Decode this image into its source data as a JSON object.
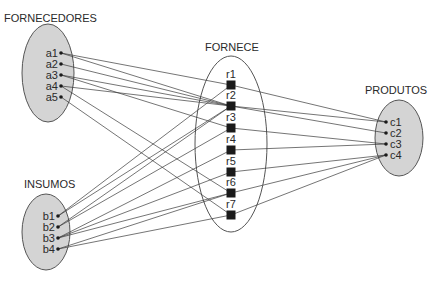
{
  "diagram": {
    "sets": [
      {
        "id": "fornecedores",
        "title": "FORNECEDORES",
        "title_x": 4,
        "title_y": 22,
        "cx": 48,
        "cy": 73,
        "rx": 26,
        "ry": 49,
        "fill": "#d4d4d4",
        "elements": [
          {
            "id": "a1",
            "label": "a1",
            "x": 61,
            "y": 53
          },
          {
            "id": "a2",
            "label": "a2",
            "x": 61,
            "y": 64
          },
          {
            "id": "a3",
            "label": "a3",
            "x": 61,
            "y": 75
          },
          {
            "id": "a4",
            "label": "a4",
            "x": 61,
            "y": 86
          },
          {
            "id": "a5",
            "label": "a5",
            "x": 61,
            "y": 97
          }
        ]
      },
      {
        "id": "insumos",
        "title": "INSUMOS",
        "title_x": 24,
        "title_y": 188,
        "cx": 46,
        "cy": 232,
        "rx": 24,
        "ry": 38,
        "fill": "#d4d4d4",
        "elements": [
          {
            "id": "b1",
            "label": "b1",
            "x": 58,
            "y": 216
          },
          {
            "id": "b2",
            "label": "b2",
            "x": 58,
            "y": 227
          },
          {
            "id": "b3",
            "label": "b3",
            "x": 58,
            "y": 238
          },
          {
            "id": "b4",
            "label": "b4",
            "x": 58,
            "y": 249
          }
        ]
      },
      {
        "id": "produtos",
        "title": "PRODUTOS",
        "title_x": 365,
        "title_y": 94,
        "cx": 399,
        "cy": 138,
        "rx": 24,
        "ry": 38,
        "fill": "#d4d4d4",
        "elements": [
          {
            "id": "c1",
            "label": "c1",
            "x": 386,
            "y": 122
          },
          {
            "id": "c2",
            "label": "c2",
            "x": 386,
            "y": 133
          },
          {
            "id": "c3",
            "label": "c3",
            "x": 386,
            "y": 144
          },
          {
            "id": "c4",
            "label": "c4",
            "x": 386,
            "y": 155
          }
        ]
      }
    ],
    "relation": {
      "id": "fornece",
      "title": "FORNECE",
      "title_x": 205,
      "title_y": 51,
      "cx": 231,
      "cy": 144,
      "rx": 36,
      "ry": 88,
      "fill": "#ffffff",
      "nodes": [
        {
          "id": "r1",
          "label": "r1",
          "x": 231,
          "y": 85
        },
        {
          "id": "r2",
          "label": "r2",
          "x": 231,
          "y": 106
        },
        {
          "id": "r3",
          "label": "r3",
          "x": 231,
          "y": 128
        },
        {
          "id": "r4",
          "label": "r4",
          "x": 231,
          "y": 150
        },
        {
          "id": "r5",
          "label": "r5",
          "x": 231,
          "y": 172
        },
        {
          "id": "r6",
          "label": "r6",
          "x": 231,
          "y": 193
        },
        {
          "id": "r7",
          "label": "r7",
          "x": 231,
          "y": 215
        }
      ]
    },
    "edges": [
      [
        "a1",
        "r1"
      ],
      [
        "a1",
        "r2"
      ],
      [
        "a2",
        "r2"
      ],
      [
        "a3",
        "r3"
      ],
      [
        "a3",
        "r2"
      ],
      [
        "a4",
        "r2"
      ],
      [
        "a4",
        "r6"
      ],
      [
        "a5",
        "r7"
      ],
      [
        "b1",
        "r1"
      ],
      [
        "b1",
        "r2"
      ],
      [
        "b2",
        "r2"
      ],
      [
        "b2",
        "r3"
      ],
      [
        "b3",
        "r4"
      ],
      [
        "b3",
        "r6"
      ],
      [
        "b3",
        "r5"
      ],
      [
        "b4",
        "r7"
      ],
      [
        "b4",
        "r6"
      ],
      [
        "r1",
        "c1"
      ],
      [
        "r2",
        "c1"
      ],
      [
        "r2",
        "c2"
      ],
      [
        "r3",
        "c3"
      ],
      [
        "r4",
        "c3"
      ],
      [
        "r5",
        "c4"
      ],
      [
        "r6",
        "c4"
      ],
      [
        "r7",
        "c4"
      ]
    ],
    "colors": {
      "line": "#3a3a3a",
      "node": "#1a1a1a",
      "ellipse_stroke": "#555555",
      "text": "#2a2a2a"
    }
  }
}
